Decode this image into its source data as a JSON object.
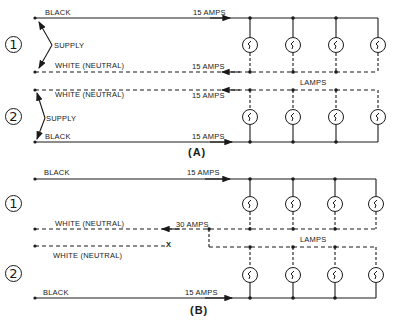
{
  "diagram": {
    "part_a": {
      "caption": "(A)",
      "circuit1": {
        "number": "1",
        "black_label": "BLACK",
        "black_current": "15 AMPS",
        "supply_label": "SUPPLY",
        "neutral_label": "WHITE (NEUTRAL)",
        "neutral_current": "15 AMPS",
        "lamp_count": 4
      },
      "lamps_label": "LAMPS",
      "circuit2": {
        "number": "2",
        "neutral_label": "WHITE (NEUTRAL)",
        "neutral_current": "15 AMPS",
        "supply_label": "SUPPLY",
        "black_label": "BLACK",
        "black_current": "15 AMPS",
        "lamp_count": 4
      }
    },
    "part_b": {
      "caption": "(B)",
      "circuit1": {
        "number": "1",
        "black_label": "BLACK",
        "black_current": "15 AMPS",
        "neutral_label": "WHITE (NEUTRAL)",
        "neutral_current": "30 AMPS",
        "lamp_count": 4
      },
      "lamps_label": "LAMPS",
      "circuit2": {
        "number": "2",
        "neutral_label": "WHITE (NEUTRAL)",
        "neutral_break_mark": "X",
        "black_label": "BLACK",
        "black_current": "15 AMPS",
        "lamp_count": 4
      }
    },
    "colors": {
      "line": "#1a1a1a",
      "background": "#ffffff"
    }
  }
}
